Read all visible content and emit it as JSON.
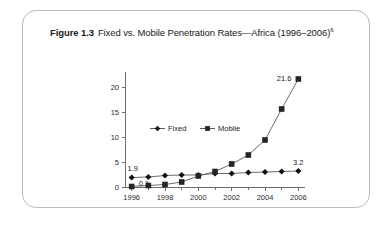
{
  "figure": {
    "label": "Figure 1.3",
    "title": "Fixed vs. Mobile Penetration Rates—Africa (1996–2006)",
    "footnote_marker": "6"
  },
  "colors": {
    "card_border": "#b9b9b9",
    "axis": "#6e6e6e",
    "series_line": "#5c5c5c",
    "marker_fixed": "#121212",
    "marker_mobile": "#242424",
    "text": "#1a1a1a",
    "background": "#ffffff"
  },
  "chart_data": {
    "type": "line",
    "title": "Fixed vs. Mobile Penetration Rates—Africa (1996–2006)",
    "xlabel": "",
    "ylabel": "",
    "x": [
      1996,
      1997,
      1998,
      1999,
      2000,
      2001,
      2002,
      2003,
      2004,
      2005,
      2006
    ],
    "xtick_labels": [
      "1996",
      "1998",
      "2000",
      "2002",
      "2004",
      "2006"
    ],
    "xtick_values": [
      1996,
      1998,
      2000,
      2002,
      2004,
      2006
    ],
    "xlim": [
      1995.6,
      2006.4
    ],
    "ytick_labels": [
      "0",
      "5",
      "10",
      "15",
      "20"
    ],
    "ytick_values": [
      0,
      5,
      10,
      15,
      20
    ],
    "ylim": [
      0,
      22.6
    ],
    "grid": false,
    "legend_position": "upper-left-inside",
    "series": [
      {
        "name": "Fixed",
        "marker": "diamond",
        "values": [
          1.9,
          2.0,
          2.3,
          2.4,
          2.4,
          2.7,
          2.7,
          2.9,
          3.0,
          3.1,
          3.2
        ]
      },
      {
        "name": "Mobile",
        "marker": "square",
        "values": [
          0.1,
          0.3,
          0.5,
          1.0,
          2.2,
          3.1,
          4.6,
          6.4,
          9.4,
          15.6,
          21.6
        ]
      }
    ],
    "annotations": [
      {
        "text": "1.9",
        "series": "Fixed",
        "x": 1996,
        "y": 1.9
      },
      {
        "text": "0.1",
        "series": "Mobile",
        "x": 1996,
        "y": 0.1
      },
      {
        "text": "21.6",
        "series": "Mobile",
        "x": 2006,
        "y": 21.6
      },
      {
        "text": "3.2",
        "series": "Fixed",
        "x": 2006,
        "y": 3.2
      }
    ]
  }
}
